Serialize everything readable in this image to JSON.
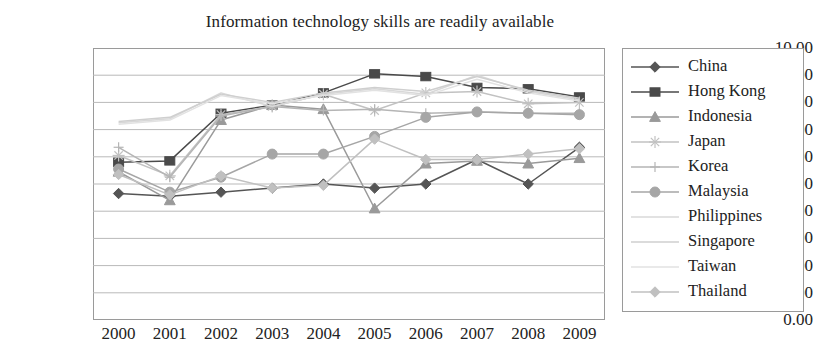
{
  "chart_data": {
    "type": "line",
    "title": "Information technology skills are readily available",
    "xlabel": "",
    "ylabel": "",
    "categories": [
      "2000",
      "2001",
      "2002",
      "2003",
      "2004",
      "2005",
      "2006",
      "2007",
      "2008",
      "2009"
    ],
    "x_tick_labels": [
      "2000",
      "2001",
      "2002",
      "2003",
      "2004",
      "2005",
      "2006",
      "2007",
      "2008",
      "2009"
    ],
    "y_tick_labels": [
      "10.00",
      "9.00",
      "8.00",
      "7.00",
      "6.00",
      "5.00",
      "4.00",
      "3.00",
      "2.00",
      "1.00",
      "0.00"
    ],
    "ylim": [
      0,
      10
    ],
    "y_step": 1,
    "grid": "horizontal",
    "legend_position": "right",
    "series": [
      {
        "name": "China",
        "marker": "diamond",
        "color": "#555555",
        "values": [
          4.65,
          4.55,
          4.7,
          4.85,
          5.0,
          4.85,
          5.0,
          5.9,
          5.0,
          6.35
        ]
      },
      {
        "name": "Hong Kong",
        "marker": "square",
        "color": "#4a4a4a",
        "values": [
          5.8,
          5.85,
          7.6,
          7.9,
          8.35,
          9.05,
          8.95,
          8.55,
          8.5,
          8.2
        ]
      },
      {
        "name": "Indonesia",
        "marker": "triangle",
        "color": "#9a9a9a",
        "values": [
          5.45,
          4.4,
          7.35,
          7.9,
          7.75,
          4.1,
          5.75,
          5.85,
          5.75,
          5.95
        ]
      },
      {
        "name": "Japan",
        "marker": "star",
        "color": "#c2c2c2",
        "values": [
          6.05,
          5.3,
          7.55,
          7.85,
          8.3,
          7.7,
          8.35,
          8.4,
          7.95,
          8.0
        ]
      },
      {
        "name": "Korea",
        "marker": "cross",
        "color": "#b5b5b5",
        "values": [
          6.35,
          5.25,
          7.5,
          7.85,
          7.7,
          7.75,
          7.6,
          7.65,
          7.6,
          7.6
        ]
      },
      {
        "name": "Malaysia",
        "marker": "circle",
        "color": "#a6a6a6",
        "values": [
          5.55,
          4.7,
          5.25,
          6.1,
          6.1,
          6.75,
          7.45,
          7.65,
          7.6,
          7.55
        ]
      },
      {
        "name": "Philippines",
        "marker": "none",
        "color": "#d8d8d8",
        "values": [
          7.25,
          7.4,
          8.35,
          7.85,
          8.3,
          8.5,
          8.3,
          9.0,
          8.4,
          8.1
        ]
      },
      {
        "name": "Singapore",
        "marker": "none",
        "color": "#cfcfcf",
        "values": [
          7.3,
          7.45,
          8.3,
          8.0,
          8.35,
          8.55,
          8.4,
          8.95,
          8.45,
          8.15
        ]
      },
      {
        "name": "Taiwan",
        "marker": "none",
        "color": "#e2e2e2",
        "values": [
          7.2,
          7.35,
          8.25,
          7.95,
          8.25,
          8.45,
          8.25,
          8.85,
          8.35,
          8.05
        ]
      },
      {
        "name": "Thailand",
        "marker": "diamond",
        "color": "#c0c0c0",
        "values": [
          5.35,
          4.6,
          5.3,
          4.85,
          4.95,
          6.65,
          5.9,
          5.9,
          6.1,
          6.3
        ]
      }
    ]
  },
  "colors": {
    "axis": "#9a9a9a",
    "grid": "#b9b9b9",
    "text": "#222222",
    "background": "#ffffff"
  }
}
